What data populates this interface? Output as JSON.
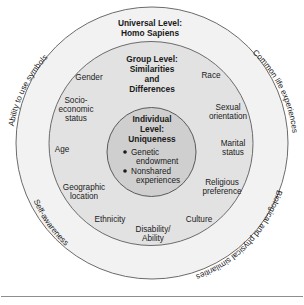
{
  "figure": {
    "title_universal": [
      "Universal Level:",
      "Homo Sapiens"
    ],
    "title_group": [
      "Group Level:",
      "Similarities",
      "and",
      "Differences"
    ],
    "title_individual": [
      "Individual",
      "Level:",
      "Uniqueness"
    ],
    "individual_bullets": [
      [
        "Genetic",
        "endowment"
      ],
      [
        "Nonshared",
        "experiences"
      ]
    ],
    "group_labels": {
      "gender": "Gender",
      "race": "Race",
      "socioeconomic": [
        "Socio-",
        "economic",
        "status"
      ],
      "sexual_orientation": [
        "Sexual",
        "orientation"
      ],
      "age": "Age",
      "marital_status": [
        "Marital",
        "status"
      ],
      "geographic_location": [
        "Geographic",
        "location"
      ],
      "religious_preference": [
        "Religious",
        "preference"
      ],
      "ethnicity": "Ethnicity",
      "culture": "Culture",
      "disability_ability": [
        "Disability/",
        "Ability"
      ]
    },
    "universal_arc_labels": {
      "top_left": "Ability to use symbols",
      "top_right": "Common life experiences",
      "bottom_left": "Self-awareness",
      "bottom_right": "Biological and physical similarities"
    },
    "colors": {
      "outer_fill": "#f2f2f2",
      "middle_fill": "#e2e2e2",
      "inner_fill": "#cfcfcf",
      "stroke": "#6b6b6b",
      "text": "#1a1a1a"
    }
  }
}
